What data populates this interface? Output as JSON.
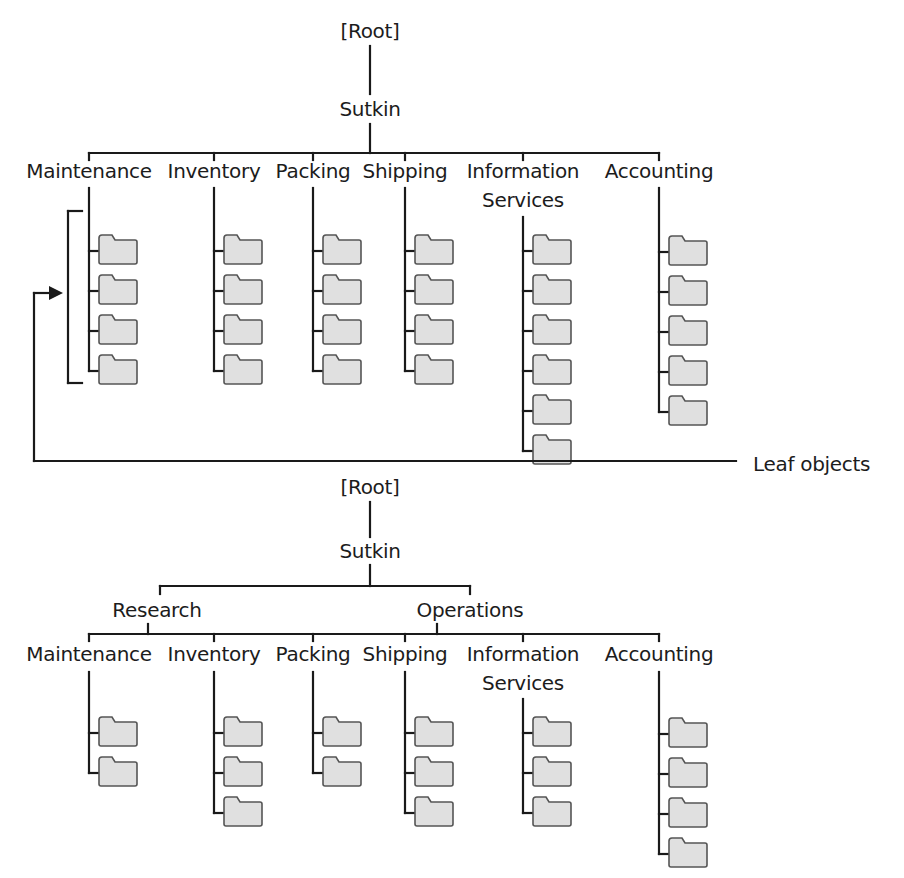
{
  "colors": {
    "line": "#1a1a1a",
    "folder_fill": "#e0e0e0",
    "folder_stroke": "#555555"
  },
  "diagram_top": {
    "root": {
      "label": "[Root]",
      "x": 370,
      "y": 20
    },
    "org": {
      "label": "Sutkin",
      "x": 370,
      "y": 98
    },
    "root_to_org_line": [
      370,
      46,
      370,
      94
    ],
    "org_down_line": [
      370,
      124,
      370,
      153
    ],
    "branch_bar": {
      "x1": 89,
      "x2": 659,
      "y": 153
    },
    "departments": [
      {
        "label": "Maintenance",
        "lines": [
          "Maintenance"
        ],
        "x": 89,
        "trunk_top": 188,
        "folders": 4,
        "first_y": 238
      },
      {
        "label": "Inventory",
        "lines": [
          "Inventory"
        ],
        "x": 214,
        "trunk_top": 188,
        "folders": 4,
        "first_y": 238
      },
      {
        "label": "Packing",
        "lines": [
          "Packing"
        ],
        "x": 313,
        "trunk_top": 188,
        "folders": 4,
        "first_y": 238
      },
      {
        "label": "Shipping",
        "lines": [
          "Shipping"
        ],
        "x": 405,
        "trunk_top": 188,
        "folders": 4,
        "first_y": 238
      },
      {
        "label": "Information Services",
        "lines": [
          "Information",
          "Services"
        ],
        "x": 523,
        "trunk_top": 217,
        "folders": 6,
        "first_y": 238
      },
      {
        "label": "Accounting",
        "lines": [
          "Accounting"
        ],
        "x": 659,
        "trunk_top": 188,
        "folders": 5,
        "first_y": 239
      }
    ],
    "label_y": 160,
    "folder_spacing": 40,
    "bracket": {
      "x": 68,
      "y1": 211,
      "y2": 383,
      "tick": 14
    },
    "leaf_callout": {
      "label": "Leaf objects",
      "line_y": 461,
      "x_left": 34,
      "x_right": 736,
      "arrow_y": 293,
      "arrow_tip_x": 63,
      "label_x": 753,
      "label_y": 453
    }
  },
  "diagram_bottom": {
    "root": {
      "label": "[Root]",
      "x": 370,
      "y": 476
    },
    "org": {
      "label": "Sutkin",
      "x": 370,
      "y": 540
    },
    "root_to_org_line": [
      370,
      502,
      370,
      537
    ],
    "org_down_line": [
      370,
      565,
      370,
      586
    ],
    "division_bar": {
      "x1": 160,
      "x2": 470,
      "y": 586
    },
    "divisions": [
      {
        "label": "Research",
        "x": 157,
        "y": 599
      },
      {
        "label": "Operations",
        "x": 470,
        "y": 599
      }
    ],
    "division_down_lines": [
      [
        148,
        624,
        148,
        634
      ],
      [
        437,
        624,
        437,
        634
      ]
    ],
    "branch_bar": {
      "x1": 89,
      "x2": 659,
      "y": 634
    },
    "departments": [
      {
        "label": "Maintenance",
        "lines": [
          "Maintenance"
        ],
        "x": 89,
        "trunk_top": 672,
        "folders": 2,
        "first_y": 720
      },
      {
        "label": "Inventory",
        "lines": [
          "Inventory"
        ],
        "x": 214,
        "trunk_top": 672,
        "folders": 3,
        "first_y": 720
      },
      {
        "label": "Packing",
        "lines": [
          "Packing"
        ],
        "x": 313,
        "trunk_top": 672,
        "folders": 2,
        "first_y": 720
      },
      {
        "label": "Shipping",
        "lines": [
          "Shipping"
        ],
        "x": 405,
        "trunk_top": 672,
        "folders": 3,
        "first_y": 720
      },
      {
        "label": "Information Services",
        "lines": [
          "Information",
          "Services"
        ],
        "x": 523,
        "trunk_top": 699,
        "folders": 3,
        "first_y": 720
      },
      {
        "label": "Accounting",
        "lines": [
          "Accounting"
        ],
        "x": 659,
        "trunk_top": 672,
        "folders": 4,
        "first_y": 721
      }
    ],
    "label_y": 643,
    "folder_spacing": 40
  }
}
